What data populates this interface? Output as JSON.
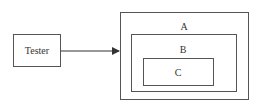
{
  "diagram": {
    "type": "nested-boxes-with-arrow",
    "nodes": [
      {
        "id": "tester",
        "label": "Tester",
        "x": 13,
        "y": 34,
        "w": 48,
        "h": 33
      },
      {
        "id": "a",
        "label": "A",
        "x": 120,
        "y": 12,
        "w": 129,
        "h": 88
      },
      {
        "id": "b",
        "label": "B",
        "x": 131,
        "y": 34,
        "w": 106,
        "h": 58
      },
      {
        "id": "c",
        "label": "C",
        "x": 143,
        "y": 58,
        "w": 71,
        "h": 28
      }
    ],
    "edges": [
      {
        "from": "tester",
        "to": "a",
        "style": "solid-arrow"
      }
    ],
    "colors": {
      "stroke": "#555555",
      "text": "#333333",
      "background": "#ffffff"
    }
  }
}
